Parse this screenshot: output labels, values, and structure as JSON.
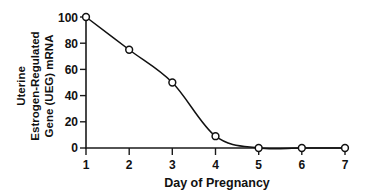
{
  "chart_data": {
    "type": "line",
    "title": "",
    "xlabel": "Day of Pregnancy",
    "ylabel": "Uterine Estrogen-Regulated Gene (UEG) mRNA",
    "ylabel_lines": [
      "Uterine",
      "Estrogen-Regulated",
      "Gene (UEG) mRNA"
    ],
    "x": [
      1,
      2,
      3,
      4,
      5,
      6,
      7
    ],
    "values": [
      100,
      75,
      50,
      9,
      0,
      0,
      0
    ],
    "categories": [
      "1",
      "2",
      "3",
      "4",
      "5",
      "6",
      "7"
    ],
    "xtick_labels": [
      "1",
      "2",
      "3",
      "4",
      "5",
      "6",
      "7"
    ],
    "ytick_labels": [
      "0",
      "20",
      "40",
      "60",
      "80",
      "100"
    ],
    "yticks": [
      0,
      20,
      40,
      60,
      80,
      100
    ],
    "xlim": [
      1,
      7
    ],
    "ylim": [
      0,
      100
    ],
    "grid": false,
    "legend": "none",
    "marker": "open-circle",
    "line_color": "#111111",
    "marker_face_color": "#ffffff",
    "marker_edge_color": "#111111",
    "background_color": "#ffffff",
    "smoothing": "sigmoid-spline",
    "series": [
      {
        "name": "UEG mRNA",
        "values": [
          100,
          75,
          50,
          9,
          0,
          0,
          0
        ]
      }
    ]
  }
}
